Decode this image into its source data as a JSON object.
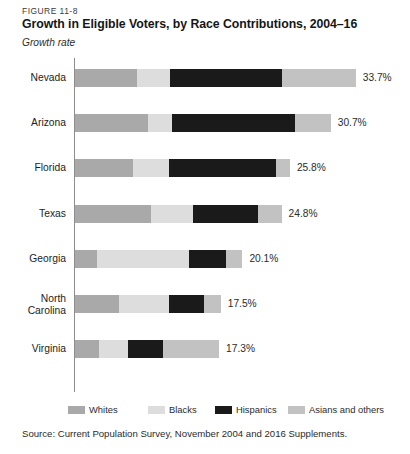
{
  "figure": {
    "number": "FIGURE 11-8",
    "title": "Growth in Eligible Voters, by Race Contributions, 2004–16",
    "axis_caption": "Growth rate",
    "source": "Source: Current Population Survey, November 2004 and 2016 Supplements."
  },
  "legend": {
    "items": [
      {
        "label": "Whites",
        "color": "#a9a9a9",
        "key": "whites"
      },
      {
        "label": "Blacks",
        "color": "#dddddd",
        "key": "blacks"
      },
      {
        "label": "Hispanics",
        "color": "#1a1a1a",
        "key": "hispanics"
      },
      {
        "label": "Asians and others",
        "color": "#c2c2c2",
        "key": "asians"
      }
    ]
  },
  "chart_data": {
    "type": "bar",
    "orientation": "horizontal",
    "stacked": true,
    "title": "Growth in Eligible Voters, by Race Contributions, 2004–16",
    "subtitle": "FIGURE 11-8",
    "xlabel": "Growth rate",
    "ylabel": "",
    "xlim": [
      0,
      35
    ],
    "grid": false,
    "legend_position": "bottom",
    "categories": [
      "Nevada",
      "Arizona",
      "Florida",
      "Texas",
      "Georgia",
      "North Carolina",
      "Virginia"
    ],
    "series": [
      {
        "name": "Whites",
        "color": "#a9a9a9",
        "values": [
          7.4,
          8.8,
          7.0,
          9.1,
          2.6,
          5.3,
          2.9
        ]
      },
      {
        "name": "Blacks",
        "color": "#dddddd",
        "values": [
          4.0,
          2.9,
          4.3,
          5.1,
          11.1,
          6.0,
          3.5
        ]
      },
      {
        "name": "Hispanics",
        "color": "#1a1a1a",
        "values": [
          13.4,
          14.7,
          12.8,
          7.8,
          4.4,
          4.2,
          4.2
        ]
      },
      {
        "name": "Asians and others",
        "color": "#c2c2c2",
        "values": [
          8.9,
          4.3,
          1.7,
          2.8,
          2.0,
          2.0,
          6.7
        ]
      }
    ],
    "totals": [
      33.7,
      30.7,
      25.8,
      24.8,
      20.1,
      17.5,
      17.3
    ],
    "total_labels": [
      "33.7%",
      "30.7%",
      "25.8%",
      "24.8%",
      "20.1%",
      "17.5%",
      "17.3%"
    ]
  },
  "rows": [
    {
      "label": "Nevada",
      "label_lines": [
        "Nevada"
      ],
      "total_label": "33.7%"
    },
    {
      "label": "Arizona",
      "label_lines": [
        "Arizona"
      ],
      "total_label": "30.7%"
    },
    {
      "label": "Florida",
      "label_lines": [
        "Florida"
      ],
      "total_label": "25.8%"
    },
    {
      "label": "Texas",
      "label_lines": [
        "Texas"
      ],
      "total_label": "24.8%"
    },
    {
      "label": "Georgia",
      "label_lines": [
        "Georgia"
      ],
      "total_label": "20.1%"
    },
    {
      "label": "North Carolina",
      "label_lines": [
        "North",
        "Carolina"
      ],
      "total_label": "17.5%"
    },
    {
      "label": "Virginia",
      "label_lines": [
        "Virginia"
      ],
      "total_label": "17.3%"
    }
  ]
}
